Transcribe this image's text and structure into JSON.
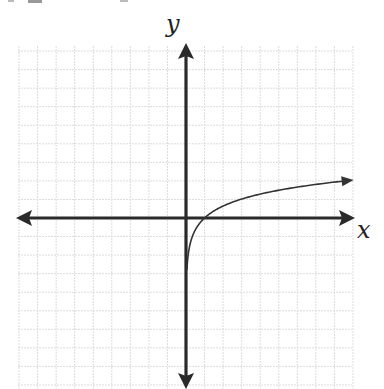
{
  "chart_data": {
    "type": "line",
    "title": "",
    "xlabel": "x",
    "ylabel": "y",
    "function": "y = ln(x) (logarithmic curve, x > 0)",
    "grid": true,
    "xlim": [
      -9,
      9
    ],
    "ylim": [
      -9,
      9
    ],
    "tick_labels": "none",
    "x_intercept": [
      1,
      0
    ],
    "vertical_asymptote": "x = 0",
    "series": [
      {
        "name": "log curve",
        "x": [
          0.06,
          0.1,
          0.25,
          0.5,
          1,
          2,
          3,
          4,
          5,
          6,
          7,
          8,
          9
        ],
        "y": [
          -2.7,
          -2.2,
          -1.3,
          -0.65,
          0,
          0.65,
          1.05,
          1.3,
          1.5,
          1.7,
          1.85,
          1.97,
          2.05
        ]
      }
    ]
  },
  "labels": {
    "x": "x",
    "y": "y"
  },
  "colors": {
    "axis": "#2a2a2a",
    "curve": "#333333",
    "grid": "#dcdcdc"
  }
}
